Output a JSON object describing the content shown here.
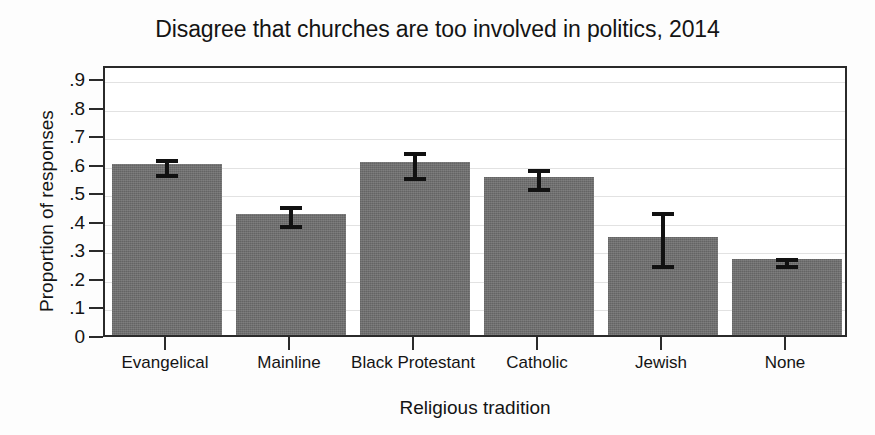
{
  "chart_data": {
    "type": "bar",
    "title": "Disagree that churches are too involved in politics, 2014",
    "xlabel": "Religious tradition",
    "ylabel": "Proportion of responses",
    "categories": [
      "Evangelical",
      "Mainline",
      "Black Protestant",
      "Catholic",
      "Jewish",
      "None"
    ],
    "values": [
      0.6,
      0.425,
      0.605,
      0.555,
      0.345,
      0.265
    ],
    "error_low": [
      0.565,
      0.385,
      0.555,
      0.515,
      0.245,
      0.245
    ],
    "error_high": [
      0.63,
      0.465,
      0.655,
      0.595,
      0.445,
      0.285
    ],
    "ylim": [
      0,
      0.95
    ],
    "yticks": [
      0,
      0.1,
      0.2,
      0.3,
      0.4,
      0.5,
      0.6,
      0.7,
      0.8,
      0.9
    ],
    "ytick_labels": [
      "0",
      ".1",
      ".2",
      ".3",
      ".4",
      ".5",
      ".6",
      ".7",
      ".8",
      ".9"
    ],
    "grid": true,
    "legend": "none",
    "bar_color": "#6f6f6f",
    "error_color": "#111111",
    "axis_color": "#2a2a2a",
    "grid_color": "#e2e2e2",
    "background": "#ffffff"
  }
}
